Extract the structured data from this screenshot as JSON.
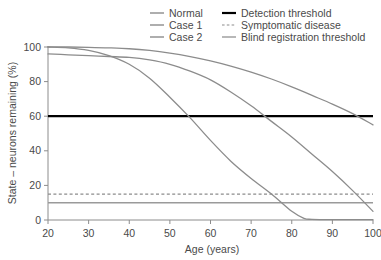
{
  "chart_data": {
    "type": "line",
    "title": "",
    "subtitle": "",
    "xlabel": "Age (years)",
    "ylabel": "State – neurons remaining (%)",
    "xlim": [
      20,
      100
    ],
    "ylim": [
      0,
      100
    ],
    "xticks": [
      20,
      30,
      40,
      50,
      60,
      70,
      80,
      90,
      100
    ],
    "yticks": [
      0,
      20,
      40,
      60,
      80,
      100
    ],
    "xtick_labels": [
      "20",
      "30",
      "40",
      "50",
      "60",
      "70",
      "80",
      "90",
      "100"
    ],
    "ytick_labels": [
      "0",
      "20",
      "40",
      "60",
      "80",
      "100"
    ],
    "grid": false,
    "legend_position": "top-right",
    "series": [
      {
        "name": "Normal",
        "color": "#8c8c8c",
        "style": "solid",
        "width": 1.3,
        "x": [
          20,
          25,
          30,
          35,
          40,
          45,
          50,
          55,
          60,
          65,
          70,
          75,
          80,
          85,
          90,
          95,
          100
        ],
        "values": [
          100,
          100,
          99.8,
          99.5,
          99,
          98,
          96.5,
          94.5,
          92,
          89,
          85.5,
          81.5,
          77,
          72,
          67,
          61.5,
          55
        ]
      },
      {
        "name": "Case 1",
        "color": "#8c8c8c",
        "style": "solid",
        "width": 1.3,
        "x": [
          20,
          25,
          30,
          35,
          40,
          45,
          50,
          55,
          60,
          65,
          70,
          75,
          80,
          85,
          90,
          95,
          100
        ],
        "values": [
          96,
          95.5,
          95,
          94.5,
          94,
          92.5,
          90,
          86,
          81,
          74,
          66,
          57,
          48,
          38,
          28,
          17,
          5
        ]
      },
      {
        "name": "Case 2",
        "color": "#8c8c8c",
        "style": "solid",
        "width": 1.3,
        "x": [
          20,
          25,
          30,
          35,
          40,
          45,
          50,
          55,
          60,
          65,
          70,
          75,
          80,
          83,
          85,
          90,
          95,
          100
        ],
        "values": [
          100,
          99.5,
          98,
          95,
          90,
          82,
          71,
          59,
          46,
          34,
          24,
          15,
          5,
          1,
          0.4,
          0.2,
          0.2,
          0.2
        ]
      }
    ],
    "threshold_lines": [
      {
        "name": "Detection threshold",
        "value": 60,
        "color": "#000000",
        "style": "solid",
        "width": 2.2
      },
      {
        "name": "Symptomatic disease",
        "value": 15,
        "color": "#8c8c8c",
        "style": "dashed",
        "width": 1.2
      },
      {
        "name": "Blind registration threshold",
        "value": 10,
        "color": "#9a9a9a",
        "style": "solid",
        "width": 1.4
      }
    ],
    "legend": [
      {
        "label": "Normal",
        "color": "#8c8c8c",
        "style": "solid",
        "width": 1.4,
        "col": 0,
        "row": 0
      },
      {
        "label": "Case 1",
        "color": "#8c8c8c",
        "style": "solid",
        "width": 1.4,
        "col": 0,
        "row": 1
      },
      {
        "label": "Case 2",
        "color": "#8c8c8c",
        "style": "solid",
        "width": 1.4,
        "col": 0,
        "row": 2
      },
      {
        "label": "Detection threshold",
        "color": "#000000",
        "style": "solid",
        "width": 2.2,
        "col": 1,
        "row": 0
      },
      {
        "label": "Symptomatic disease",
        "color": "#8c8c8c",
        "style": "dashed",
        "width": 1.2,
        "col": 1,
        "row": 1
      },
      {
        "label": "Blind registration threshold",
        "color": "#9a9a9a",
        "style": "solid",
        "width": 1.4,
        "col": 1,
        "row": 2
      }
    ],
    "axis_color": "#8c8c8c"
  }
}
